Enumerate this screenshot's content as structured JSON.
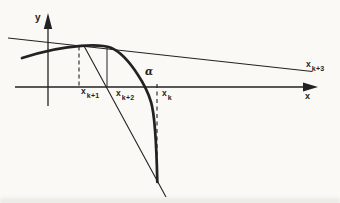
{
  "labels": {
    "y_axis": "y",
    "x_axis": "x",
    "root": "α",
    "xk1": {
      "base": "x",
      "sub": "k+1"
    },
    "xk2": {
      "base": "x",
      "sub": "k+2"
    },
    "xk": {
      "base": "x",
      "sub": "k"
    },
    "xk3": {
      "base": "x",
      "sub": "k+3"
    }
  },
  "colors": {
    "ink": "#222222",
    "background": "#faf9f5"
  }
}
